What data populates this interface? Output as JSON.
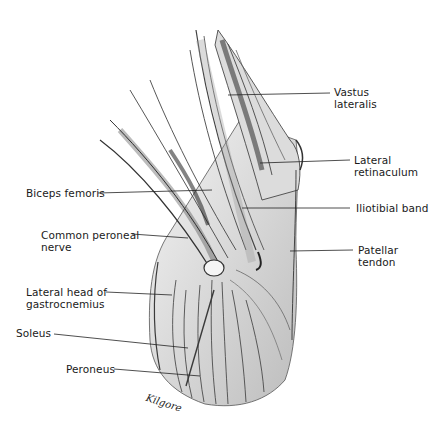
{
  "figure": {
    "artist_signature": "Kilgore",
    "colors": {
      "background": "#ffffff",
      "ink": "#1a1a1a",
      "shade_dark": "#3a3a3a",
      "shade_mid": "#8a8a8a",
      "shade_light": "#d6d6d6"
    }
  },
  "labels": {
    "vastus_lateralis": {
      "line1": "Vastus",
      "line2": "lateralis",
      "side": "right"
    },
    "lateral_retinaculum": {
      "line1": "Lateral",
      "line2": "retinaculum",
      "side": "right"
    },
    "iliotibial_band": {
      "line1": "Iliotibial band",
      "side": "right"
    },
    "patellar_tendon": {
      "line1": "Patellar",
      "line2": "tendon",
      "side": "right"
    },
    "biceps_femoris": {
      "line1": "Biceps femoris",
      "side": "left"
    },
    "common_peroneal_nerve": {
      "line1": "Common peroneal",
      "line2": "nerve",
      "side": "left"
    },
    "lateral_head_gastrocnemius": {
      "line1": "Lateral head of",
      "line2": "gastrocnemius",
      "side": "left"
    },
    "soleus": {
      "line1": "Soleus",
      "side": "left"
    },
    "peroneus": {
      "line1": "Peroneus",
      "side": "left"
    }
  }
}
